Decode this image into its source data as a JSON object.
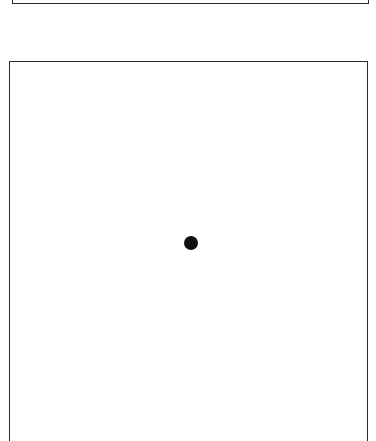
{
  "diagram": {
    "top_frame": {
      "visible_part": "bottom-edge"
    },
    "main_frame": {
      "visible_part": "top-and-sides"
    },
    "point": {
      "cx": 191,
      "cy": 243,
      "diameter": 14,
      "color": "#111111"
    }
  }
}
